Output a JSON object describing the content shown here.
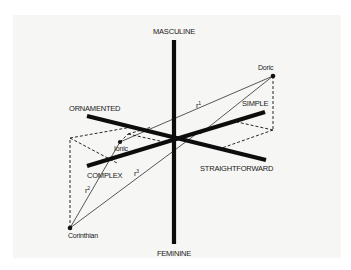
{
  "diagram": {
    "type": "3d-semantic-differential",
    "axes": [
      {
        "positive": "MASCULINE",
        "negative": "FEMININE"
      },
      {
        "positive": "ORNAMENTED",
        "negative": "STRAIGHTFORWARD"
      },
      {
        "positive": "SIMPLE",
        "negative": "COMPLEX"
      }
    ],
    "labels": {
      "masculine": "MASCULINE",
      "feminine": "FEMININE",
      "ornamented": "ORNAMENTED",
      "straightforward": "STRAIGHTFORWARD",
      "simple": "SIMPLE",
      "complex": "COMPLEX"
    },
    "points": {
      "doric": "Doric",
      "ionic": "Ionic",
      "corinthian": "Corinthian"
    },
    "distances": {
      "r1": {
        "base": "r",
        "sup": "1"
      },
      "r2": {
        "base": "r",
        "sup": "2"
      },
      "r3": {
        "base": "r",
        "sup": "3"
      }
    },
    "colors": {
      "background": "#f6f6f4",
      "ink": "#111111"
    }
  }
}
